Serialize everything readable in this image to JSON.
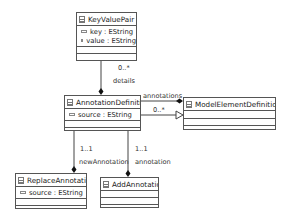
{
  "diagram": {
    "type": "uml-class-diagram",
    "classes": [
      {
        "name": "KeyValuePair",
        "attributes": [
          "key : EString",
          "value : EString"
        ]
      },
      {
        "name": "AnnotationDefinition",
        "attributes": [
          "source : EString"
        ]
      },
      {
        "name": "ModelElementDefinition",
        "attributes": []
      },
      {
        "name": "ReplaceAnnotation",
        "attributes": [
          "source : EString"
        ]
      },
      {
        "name": "AddAnnotation",
        "attributes": []
      }
    ],
    "edges": {
      "details": {
        "role": "details",
        "multiplicity": "0..*",
        "from": "AnnotationDefinition",
        "to": "KeyValuePair",
        "kind": "composition"
      },
      "annotations": {
        "role": "annotations",
        "multiplicity": "0..*",
        "from": "ModelElementDefinition",
        "to": "AnnotationDefinition",
        "kind": "composition"
      },
      "inheritance": {
        "from": "AnnotationDefinition",
        "to": "ModelElementDefinition",
        "kind": "generalization"
      },
      "newAnnotation": {
        "role": "newAnnotation",
        "multiplicity": "1..1",
        "from": "ReplaceAnnotation",
        "to": "AnnotationDefinition",
        "kind": "composition"
      },
      "annotation": {
        "role": "annotation",
        "multiplicity": "1..1",
        "from": "AddAnnotation",
        "to": "AnnotationDefinition",
        "kind": "composition"
      }
    }
  },
  "labels": {
    "details_mult": "0..*",
    "details_role": "details",
    "annotations_role": "annotations",
    "annotations_mult": "0..*",
    "newAnnotation_mult": "1..1",
    "newAnnotation_role": "newAnnotation",
    "annotation_mult": "1..1",
    "annotation_role": "annotation"
  }
}
